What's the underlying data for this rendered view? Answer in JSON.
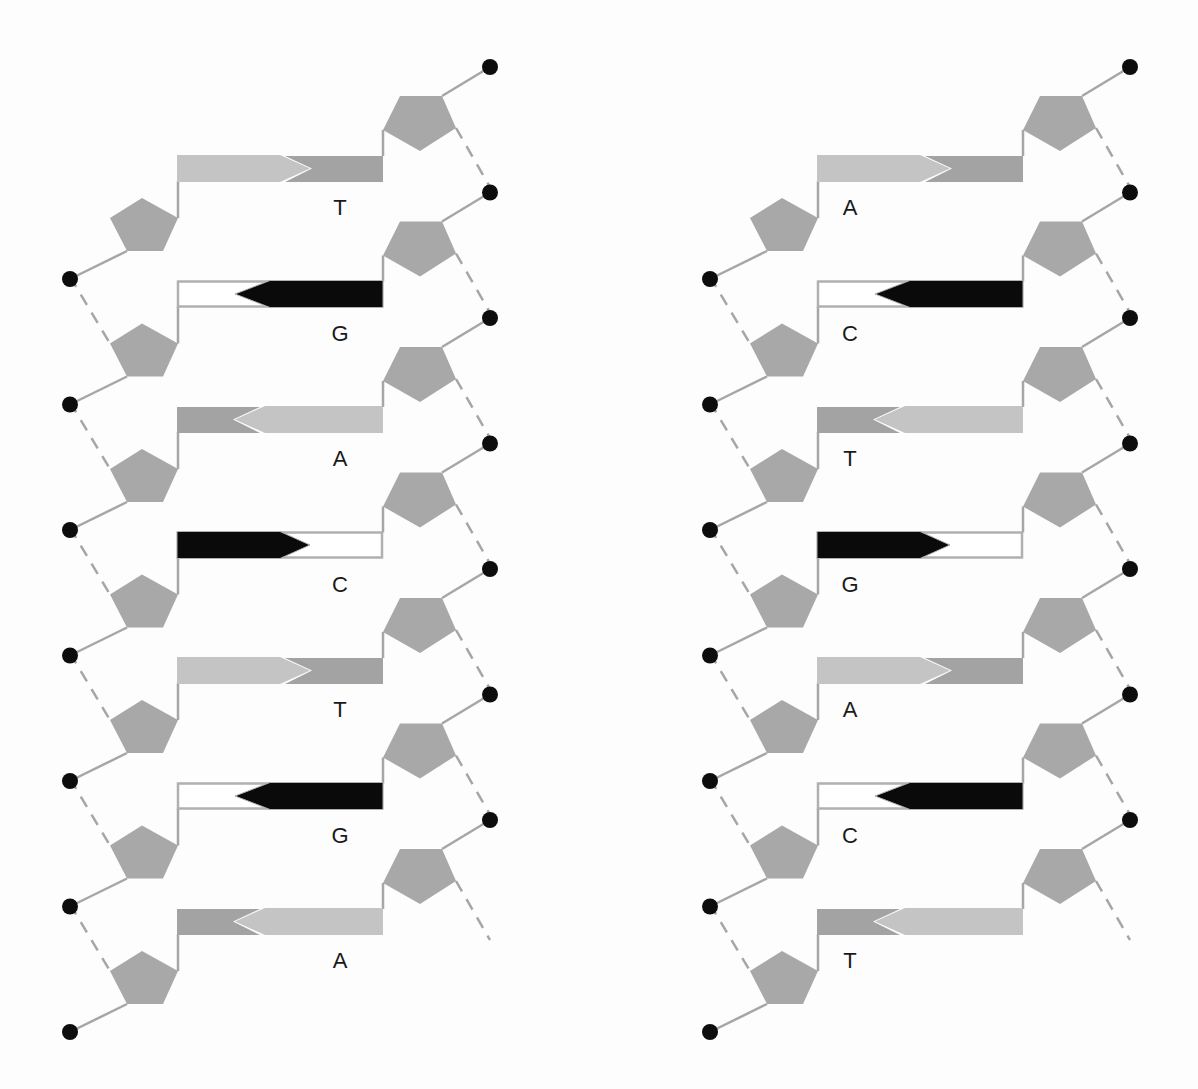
{
  "colors": {
    "sugar": "#a8a8a8",
    "phosphate": "#0d0d0d",
    "backbone": "#a6a6a6",
    "light_base": "#c4c4c4",
    "medium_base": "#a3a3a3",
    "dark_base": "#0a0a0a",
    "empty_base_fill": "#ffffff",
    "empty_base_stroke": "#b0b0b0",
    "label": "#1a1a1a"
  },
  "layout": {
    "row_start_y": 155,
    "row_step": 125.5,
    "bar_height": 27,
    "bar_left": 177,
    "bar_right": 383,
    "arrow_split": 290,
    "arrow_tip_depth": 30,
    "left_dot_x": 70,
    "right_dot_x": 490,
    "label_x": 340
  },
  "strands": [
    {
      "name": "left-strand",
      "offset_x": 0,
      "rows": [
        {
          "label": "T",
          "pattern": "light-right-into-medium"
        },
        {
          "label": "G",
          "pattern": "dark-left-into-empty"
        },
        {
          "label": "A",
          "pattern": "light-left-into-medium"
        },
        {
          "label": "C",
          "pattern": "dark-right-into-empty"
        },
        {
          "label": "T",
          "pattern": "light-right-into-medium"
        },
        {
          "label": "G",
          "pattern": "dark-left-into-empty"
        },
        {
          "label": "A",
          "pattern": "light-left-into-medium"
        }
      ]
    },
    {
      "name": "right-strand",
      "offset_x": 640,
      "rows": [
        {
          "label": "A",
          "pattern": "light-right-into-medium"
        },
        {
          "label": "C",
          "pattern": "dark-left-into-empty"
        },
        {
          "label": "T",
          "pattern": "light-left-into-medium"
        },
        {
          "label": "G",
          "pattern": "dark-right-into-empty"
        },
        {
          "label": "A",
          "pattern": "light-right-into-medium"
        },
        {
          "label": "C",
          "pattern": "dark-left-into-empty"
        },
        {
          "label": "T",
          "pattern": "light-left-into-medium"
        }
      ]
    }
  ]
}
